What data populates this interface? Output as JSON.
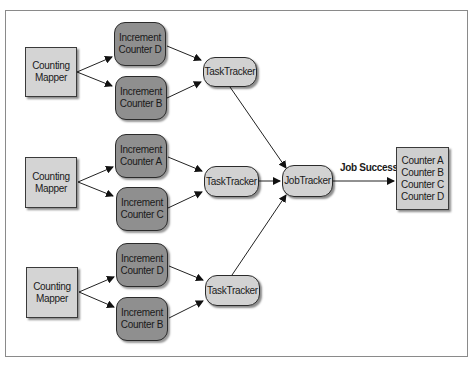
{
  "diagram": {
    "mappers": [
      {
        "line1": "Counting",
        "line2": "Mapper"
      },
      {
        "line1": "Counting",
        "line2": "Mapper"
      },
      {
        "line1": "Counting",
        "line2": "Mapper"
      }
    ],
    "increments": [
      {
        "line1": "Increment",
        "line2": "Counter D"
      },
      {
        "line1": "Increment",
        "line2": "Counter B"
      },
      {
        "line1": "Increment",
        "line2": "Counter A"
      },
      {
        "line1": "Increment",
        "line2": "Counter C"
      },
      {
        "line1": "Increment",
        "line2": "Counter D"
      },
      {
        "line1": "Increment",
        "line2": "Counter B"
      }
    ],
    "tasktrackers": [
      {
        "label": "TaskTracker"
      },
      {
        "label": "TaskTracker"
      },
      {
        "label": "TaskTracker"
      }
    ],
    "jobtracker": {
      "label": "JobTracker"
    },
    "edge_label": "Job Success",
    "counters": [
      "Counter A",
      "Counter B",
      "Counter C",
      "Counter D"
    ],
    "colors": {
      "mapper_fill": "#d4d4d4",
      "increment_fill": "#8f8f8f",
      "tracker_fill": "#d2d2d2",
      "counters_fill": "#cfcfcf",
      "stroke": "#2b2b2b"
    }
  }
}
